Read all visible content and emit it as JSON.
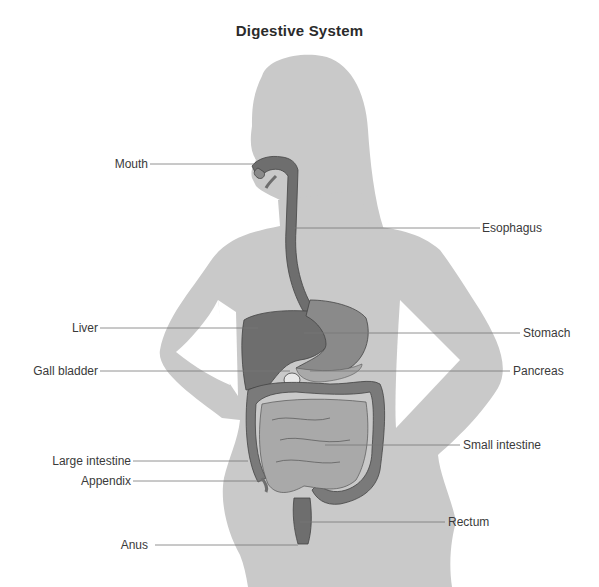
{
  "title": "Digestive System",
  "colors": {
    "silhouette": "#c9c9c9",
    "organ_dark": "#6e6e6e",
    "organ_mid": "#8a8a8a",
    "organ_light": "#a9a9a9",
    "outline": "#444444",
    "leader_line": "#777777",
    "label_text": "#3a3a3a"
  },
  "labels": {
    "left": [
      {
        "id": "mouth",
        "text": "Mouth"
      },
      {
        "id": "liver",
        "text": "Liver"
      },
      {
        "id": "gall_bladder",
        "text": "Gall bladder"
      },
      {
        "id": "large_intestine",
        "text": "Large intestine"
      },
      {
        "id": "appendix",
        "text": "Appendix"
      },
      {
        "id": "anus",
        "text": "Anus"
      }
    ],
    "right": [
      {
        "id": "esophagus",
        "text": "Esophagus"
      },
      {
        "id": "stomach",
        "text": "Stomach"
      },
      {
        "id": "pancreas",
        "text": "Pancreas"
      },
      {
        "id": "small_intestine",
        "text": "Small intestine"
      },
      {
        "id": "rectum",
        "text": "Rectum"
      }
    ]
  }
}
